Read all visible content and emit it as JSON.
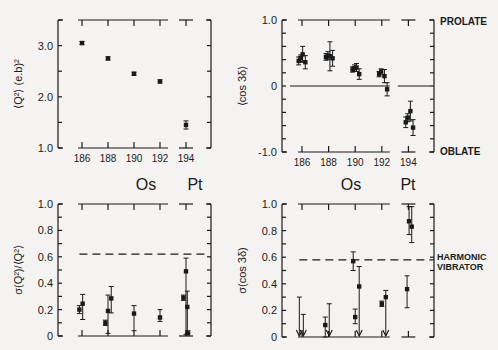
{
  "colors": {
    "ink": "#1a1a1a",
    "paper": "#f4f3f1"
  },
  "labels": {
    "os": "Os",
    "pt": "Pt",
    "prolate": "PROLATE",
    "oblate": "OBLATE",
    "harmonic_line1": "HARMONIC",
    "harmonic_line2": "VIBRATOR"
  },
  "chart_data": [
    {
      "id": "top-left",
      "type": "scatter",
      "title": "",
      "xlabel": "",
      "ylabel": "⟨Q²⟩ (e.b)²",
      "x_ticks": [
        "186",
        "188",
        "190",
        "192",
        "194"
      ],
      "y_ticks": [
        "1.0",
        "2.0",
        "3.0"
      ],
      "ylim": [
        1.0,
        3.5
      ],
      "grid": false,
      "series": [
        {
          "name": "Os",
          "x": [
            186,
            188,
            190,
            192
          ],
          "y": [
            3.05,
            2.75,
            2.45,
            2.3
          ],
          "err": [
            0.03,
            0.03,
            0.03,
            0.03
          ]
        },
        {
          "name": "Pt",
          "x": [
            194
          ],
          "y": [
            1.45
          ],
          "err": [
            0.08
          ]
        }
      ]
    },
    {
      "id": "top-right",
      "type": "scatter",
      "title": "",
      "xlabel": "",
      "ylabel": "⟨cos 3δ⟩",
      "x_ticks": [
        "186",
        "188",
        "190",
        "192",
        "194"
      ],
      "y_ticks": [
        "-1.0",
        "0",
        "1.0"
      ],
      "ylim": [
        -1.0,
        1.0
      ],
      "grid": false,
      "annotations": [
        "PROLATE",
        "OBLATE"
      ],
      "series": [
        {
          "name": "Os186",
          "x": [
            185.75,
            185.9,
            186.05,
            186.25
          ],
          "y": [
            0.38,
            0.42,
            0.48,
            0.36
          ],
          "err": [
            0.06,
            0.05,
            0.12,
            0.1
          ]
        },
        {
          "name": "Os188",
          "x": [
            187.8,
            187.95,
            188.1,
            188.3
          ],
          "y": [
            0.44,
            0.46,
            0.45,
            0.42
          ],
          "err": [
            0.05,
            0.06,
            0.22,
            0.12
          ]
        },
        {
          "name": "Os190",
          "x": [
            189.8,
            189.95,
            190.1,
            190.3
          ],
          "y": [
            0.25,
            0.27,
            0.28,
            0.18
          ],
          "err": [
            0.04,
            0.05,
            0.06,
            0.08
          ]
        },
        {
          "name": "Os192",
          "x": [
            191.8,
            191.95,
            192.2,
            192.4
          ],
          "y": [
            0.18,
            0.22,
            0.15,
            -0.05
          ],
          "err": [
            0.04,
            0.04,
            0.1,
            0.1
          ]
        },
        {
          "name": "Pt194",
          "x": [
            193.8,
            193.95,
            194.15,
            194.35
          ],
          "y": [
            -0.55,
            -0.48,
            -0.38,
            -0.63
          ],
          "err": [
            0.08,
            0.06,
            0.15,
            0.12
          ]
        }
      ]
    },
    {
      "id": "bottom-left",
      "type": "scatter",
      "title": "",
      "xlabel": "",
      "ylabel": "σ(Q²)/⟨Q²⟩",
      "x_ticks": [
        "186",
        "188",
        "190",
        "192",
        "194"
      ],
      "y_ticks": [
        "0",
        "0.2",
        "0.4",
        "0.6",
        "0.8",
        "1.0"
      ],
      "ylim": [
        0,
        1.0
      ],
      "grid": false,
      "reference_line": {
        "label": "harmonic vibrator",
        "y": 0.62,
        "style": "dashed"
      },
      "series": [
        {
          "name": "points",
          "x": [
            185.8,
            186.05,
            187.8,
            188.0,
            188.25,
            190.0,
            192.0,
            193.8,
            194.0,
            194.1,
            194.15
          ],
          "y": [
            0.2,
            0.245,
            0.1,
            0.19,
            0.285,
            0.17,
            0.14,
            0.29,
            0.49,
            0.22,
            0.02
          ],
          "err_low": [
            0.03,
            0.12,
            0.02,
            0.17,
            0.11,
            0.13,
            0.03,
            0.02,
            0.48,
            0.2,
            0.0
          ],
          "err_high": [
            0.03,
            0.07,
            0.02,
            0.12,
            0.09,
            0.06,
            0.06,
            0.02,
            0.1,
            0.12,
            0.02
          ]
        }
      ]
    },
    {
      "id": "bottom-right",
      "type": "scatter",
      "title": "",
      "xlabel": "",
      "ylabel": "σ(cos 3δ)",
      "x_ticks": [],
      "y_ticks": [
        "0",
        "0.2",
        "0.4",
        "0.6",
        "0.8",
        "1.0"
      ],
      "ylim": [
        0,
        1.0
      ],
      "grid": false,
      "reference_line": {
        "label": "HARMONIC VIBRATOR",
        "y": 0.58,
        "style": "dashed"
      },
      "series": [
        {
          "name": "points",
          "x": [
            185.8,
            186.1,
            187.75,
            188.05,
            190.0,
            190.3,
            192.0,
            192.3,
            193.9,
            194.05,
            194.25
          ],
          "y": [
            0.02,
            0.02,
            0.09,
            0.02,
            0.15,
            0.38,
            0.25,
            0.3,
            0.36,
            0.87,
            0.83
          ],
          "upper_limit": [
            0.3,
            0.17,
            0.15,
            0.25,
            0.21,
            0.53,
            0.27,
            0.35,
            0.46,
            0.98,
            0.98
          ],
          "lower": [
            0.0,
            0.0,
            0.0,
            0.0,
            0.1,
            0.0,
            0.23,
            0.0,
            0.22,
            0.77,
            0.71
          ],
          "arrows_down": [
            true,
            true,
            false,
            true,
            false,
            true,
            false,
            true,
            false,
            false,
            false
          ]
        },
        {
          "name": "Os190-high",
          "x": [
            189.85
          ],
          "y": [
            0.57
          ],
          "err": [
            0.07
          ]
        }
      ]
    }
  ]
}
